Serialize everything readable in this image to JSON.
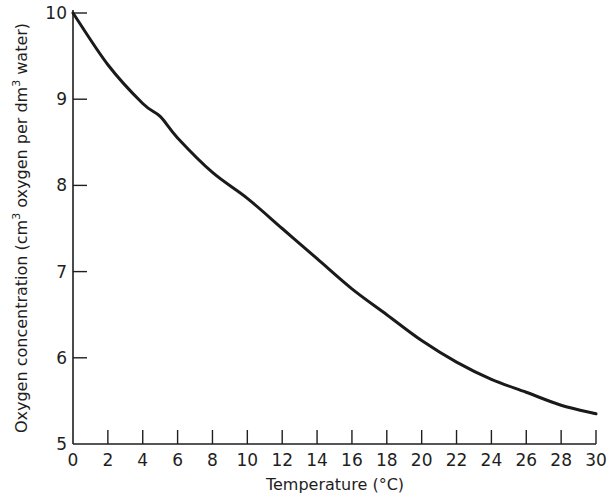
{
  "chart_data": {
    "type": "line",
    "title": "",
    "xlabel": "Temperature (°C)",
    "ylabel": "Oxygen concentration (cm³ oxygen per dm³ water)",
    "ylabel_parts": {
      "pre": "Oxygen concentration (cm",
      "sup1": "3",
      "mid": " oxygen per dm",
      "sup2": "3",
      "post": " water)"
    },
    "xlim": [
      0,
      30
    ],
    "ylim": [
      5,
      10
    ],
    "x_ticks": [
      0,
      2,
      4,
      6,
      8,
      10,
      12,
      14,
      16,
      18,
      20,
      22,
      24,
      26,
      28,
      30
    ],
    "y_ticks": [
      5,
      6,
      7,
      8,
      9,
      10
    ],
    "grid": false,
    "legend": null,
    "series": [
      {
        "name": "Oxygen concentration",
        "color": "#1a1a1a",
        "x": [
          0,
          2,
          4,
          5,
          6,
          8,
          10,
          12,
          14,
          16,
          18,
          20,
          22,
          24,
          26,
          28,
          30
        ],
        "y": [
          10.0,
          9.4,
          8.95,
          8.8,
          8.55,
          8.15,
          7.85,
          7.5,
          7.15,
          6.8,
          6.5,
          6.2,
          5.95,
          5.75,
          5.6,
          5.45,
          5.35
        ]
      }
    ]
  },
  "style": {
    "axis_color": "#1e1e1e",
    "line_color": "#1a1a1a",
    "background": "#ffffff"
  }
}
